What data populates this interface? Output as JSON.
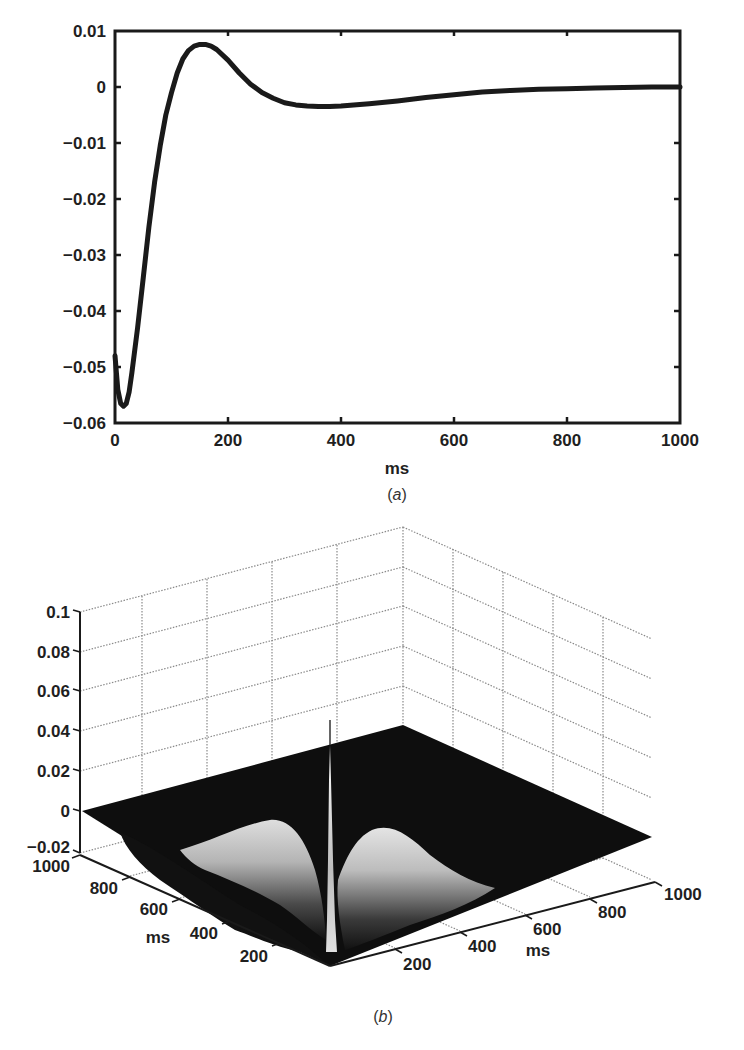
{
  "chart_data": [
    {
      "id": "a",
      "type": "line",
      "title": "",
      "caption": "(a)",
      "xlabel": "ms",
      "ylabel": "",
      "xlim": [
        0,
        1000
      ],
      "ylim": [
        -0.06,
        0.01
      ],
      "grid": false,
      "legend": null,
      "xticks": [
        "0",
        "200",
        "400",
        "600",
        "800",
        "1000"
      ],
      "yticks": [
        "0.01",
        "0",
        "−0.01",
        "−0.02",
        "−0.03",
        "−0.04",
        "−0.05",
        "−0.06"
      ],
      "series": [
        {
          "name": "kernel",
          "x": [
            0,
            5,
            10,
            15,
            20,
            25,
            30,
            40,
            50,
            60,
            70,
            80,
            90,
            100,
            110,
            120,
            130,
            140,
            150,
            160,
            170,
            180,
            200,
            220,
            240,
            260,
            280,
            300,
            320,
            340,
            360,
            380,
            400,
            450,
            500,
            550,
            600,
            650,
            700,
            750,
            800,
            850,
            900,
            950,
            1000
          ],
          "y": [
            -0.048,
            -0.054,
            -0.0565,
            -0.057,
            -0.0565,
            -0.0545,
            -0.051,
            -0.043,
            -0.034,
            -0.025,
            -0.017,
            -0.0105,
            -0.005,
            -0.001,
            0.0025,
            0.005,
            0.0065,
            0.0073,
            0.0076,
            0.0076,
            0.0073,
            0.0067,
            0.0048,
            0.0025,
            0.0005,
            -0.001,
            -0.002,
            -0.0028,
            -0.0032,
            -0.0034,
            -0.0035,
            -0.0035,
            -0.0034,
            -0.003,
            -0.0025,
            -0.0019,
            -0.0014,
            -0.0009,
            -0.0006,
            -0.0004,
            -0.0003,
            -0.0002,
            -0.0001,
            0.0,
            0.0
          ]
        }
      ]
    },
    {
      "id": "b",
      "type": "surface",
      "title": "",
      "caption": "(b)",
      "xlabel": "ms",
      "ylabel": "ms",
      "zlabel": "",
      "xlim": [
        0,
        1000
      ],
      "ylim": [
        0,
        1000
      ],
      "zlim": [
        -0.02,
        0.1
      ],
      "grid": true,
      "colormap": "gray",
      "xticks": [
        "200",
        "400",
        "600",
        "800",
        "1000"
      ],
      "yticks": [
        "200",
        "400",
        "600",
        "800",
        "1000"
      ],
      "zticks": [
        "0.1",
        "0.08",
        "0.06",
        "0.04",
        "0.02",
        "0",
        "−0.02"
      ],
      "description": "Surface is ~0 (flat dark plane) except a narrow positive ridge/spike along the diagonal near the origin (peak about 0.04) and two broad lighter troughs on either side extending up to ~400-600 ms"
    }
  ],
  "panel_a": {
    "xlabel": "ms",
    "caption_letter": "a",
    "xticks": [
      "0",
      "200",
      "400",
      "600",
      "800",
      "1000"
    ],
    "yticks": [
      "0.01",
      "0",
      "−0.01",
      "−0.02",
      "−0.03",
      "−0.04",
      "−0.05",
      "−0.06"
    ]
  },
  "panel_b": {
    "zticks": [
      "0.1",
      "0.08",
      "0.06",
      "0.04",
      "0.02",
      "0",
      "−0.02"
    ],
    "left_ticks": [
      "1000",
      "800",
      "600",
      "400",
      "200"
    ],
    "right_ticks": [
      "200",
      "400",
      "600",
      "800",
      "1000"
    ],
    "left_axis_label": "ms",
    "right_axis_label": "ms",
    "caption_letter": "b"
  }
}
